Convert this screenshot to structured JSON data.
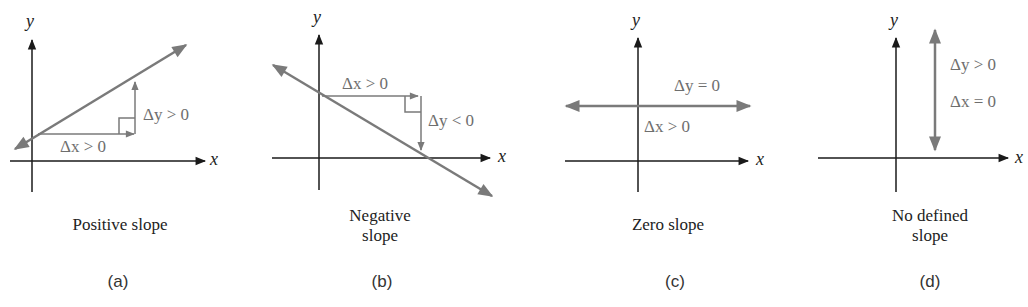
{
  "colors": {
    "axis": "#1a1a1a",
    "line": "#7a7a7a",
    "annotation": "#6e6e6e"
  },
  "panels": [
    {
      "id": "a",
      "caption": "Positive slope",
      "tag": "(a)",
      "x_label": "x",
      "y_label": "y",
      "annotations": [
        "Δx > 0",
        "Δy > 0"
      ]
    },
    {
      "id": "b",
      "caption_line1": "Negative",
      "caption_line2": "slope",
      "tag": "(b)",
      "x_label": "x",
      "y_label": "y",
      "annotations": [
        "Δx > 0",
        "Δy < 0"
      ]
    },
    {
      "id": "c",
      "caption": "Zero slope",
      "tag": "(c)",
      "x_label": "x",
      "y_label": "y",
      "annotations": [
        "Δy = 0",
        "Δx > 0"
      ]
    },
    {
      "id": "d",
      "caption_line1": "No defined",
      "caption_line2": "slope",
      "tag": "(d)",
      "x_label": "x",
      "y_label": "y",
      "annotations": [
        "Δy > 0",
        "Δx = 0"
      ]
    }
  ]
}
